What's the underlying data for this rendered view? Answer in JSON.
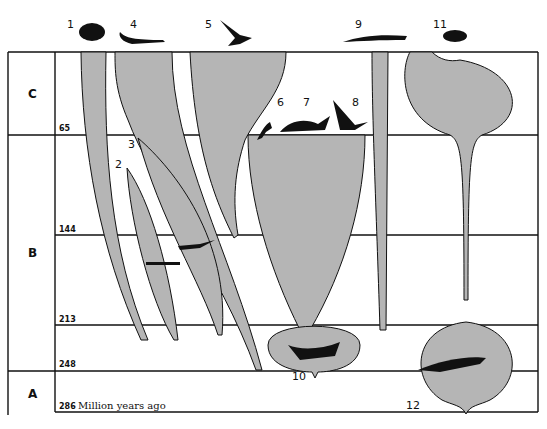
{
  "diagram": {
    "type": "phylogenetic-spindle-diagram",
    "eras": [
      {
        "id": "C",
        "label": "C"
      },
      {
        "id": "B",
        "label": "B"
      },
      {
        "id": "A",
        "label": "A"
      }
    ],
    "time_ticks": [
      {
        "value": "65"
      },
      {
        "value": "144"
      },
      {
        "value": "213"
      },
      {
        "value": "248"
      },
      {
        "value": "286"
      }
    ],
    "time_unit": "Million years ago",
    "lineages": [
      {
        "number": "1",
        "icon": "turtle-icon"
      },
      {
        "number": "2",
        "icon": "ichthyosaur-icon"
      },
      {
        "number": "3",
        "icon": "plesiosaur-icon"
      },
      {
        "number": "4",
        "icon": "crocodile-icon"
      },
      {
        "number": "5",
        "icon": "bird-icon"
      },
      {
        "number": "6",
        "icon": "theropod-dinosaur-icon"
      },
      {
        "number": "7",
        "icon": "triceratops-icon"
      },
      {
        "number": "8",
        "icon": "pterosaur-icon"
      },
      {
        "number": "9",
        "icon": "lizard-icon"
      },
      {
        "number": "10",
        "icon": "thecodont-icon"
      },
      {
        "number": "11",
        "icon": "mammal-icon"
      },
      {
        "number": "12",
        "icon": "mammal-like-reptile-icon"
      }
    ]
  }
}
